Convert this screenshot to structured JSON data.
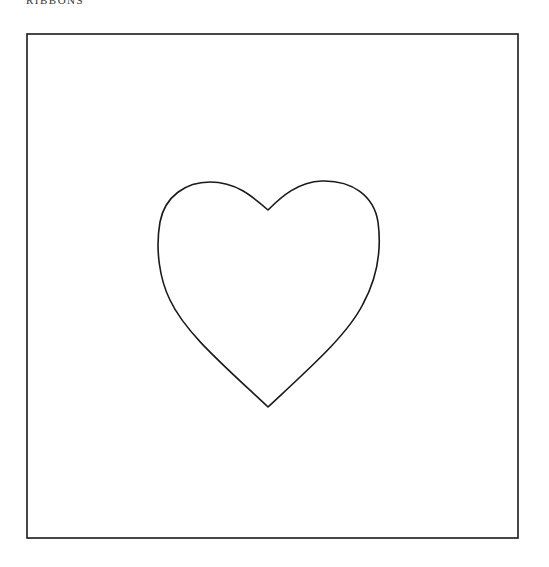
{
  "header": {
    "title": "RIBBONS"
  },
  "figure": {
    "frame": {
      "x": 27,
      "y": 34,
      "width": 491,
      "height": 504,
      "stroke": "#1a1a1a"
    },
    "shape": {
      "name": "heart",
      "stroke": "#1a1a1a",
      "fill": "#ffffff"
    }
  }
}
